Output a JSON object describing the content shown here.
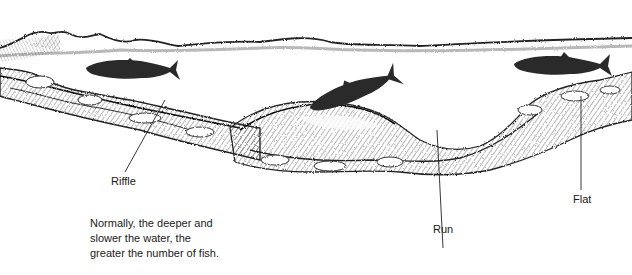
{
  "diagram": {
    "type": "river-cross-section-sketch",
    "style": "pencil illustration",
    "colors": {
      "background": "#ffffff",
      "ink": "#1a1a1a",
      "shading": "#555555",
      "fish": "#2a2a2a"
    },
    "labels": {
      "riffle": "Riffle",
      "run": "Run",
      "flat": "Flat"
    },
    "caption": {
      "lines": [
        "Normally, the deeper and",
        "slower the water, the",
        "greater the number of fish."
      ]
    },
    "elements": {
      "fish_count": 3,
      "fish": [
        {
          "position": "upper-left, near riffle",
          "direction": "left"
        },
        {
          "position": "center, over mound",
          "direction": "lower-left"
        },
        {
          "position": "upper-right, over flat",
          "direction": "left"
        }
      ]
    }
  }
}
